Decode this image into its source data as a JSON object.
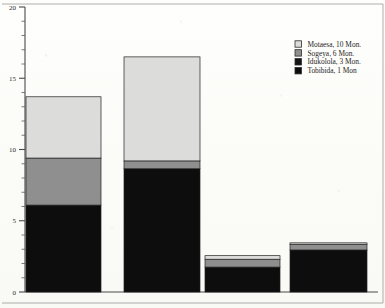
{
  "chart_data": {
    "type": "bar",
    "subtype": "stacked-bar",
    "title": "",
    "xlabel": "",
    "ylabel": "",
    "ylim": [
      0,
      20
    ],
    "yticks": [
      0,
      5,
      10,
      15,
      20
    ],
    "ytick_labels": [
      "0",
      "5",
      "10",
      "15",
      "20"
    ],
    "minor_tick_step": 1,
    "grid": false,
    "legend_position": "top-right",
    "categories": [
      "1",
      "2",
      "3",
      "4"
    ],
    "xtick_labels": [
      "",
      "",
      "",
      ""
    ],
    "series": [
      {
        "name": "Tobibida, 1 Mon",
        "color": "#0d0d0d",
        "values": [
          6.1,
          8.65,
          1.75,
          2.95
        ]
      },
      {
        "name": "Idukolola, 3 Mon.",
        "color": "#141414",
        "values": [
          0.0,
          0.0,
          0.0,
          0.0
        ]
      },
      {
        "name": "Sogeya, 6 Mon.",
        "color": "#8f8f8f",
        "values": [
          3.3,
          0.55,
          0.55,
          0.4
        ]
      },
      {
        "name": "Motaesa, 10 Mon.",
        "color": "#dcdcda",
        "values": [
          4.3,
          7.3,
          0.25,
          0.1
        ]
      }
    ],
    "bar_totals": [
      13.7,
      16.5,
      2.55,
      3.45
    ],
    "legend_entries": [
      {
        "label": "Motaesa, 10 Mon.",
        "swatch": "#dcdcda"
      },
      {
        "label": "Sogeya, 6 Mon.",
        "swatch": "#8f8f8f"
      },
      {
        "label": "Idukolola, 3 Mon.",
        "swatch": "#141414"
      },
      {
        "label": "Tobibida, 1 Mon",
        "swatch": "#0d0d0d"
      }
    ]
  },
  "axis": {
    "y_label_20": "20",
    "y_label_15": "15",
    "y_label_10": "10",
    "y_label_5": "5",
    "y_label_0": "0"
  },
  "legend": {
    "item0": "Motaesa, 10 Mon.",
    "item1": "Sogeya, 6 Mon.",
    "item2": "Idukolola, 3 Mon.",
    "item3": "Tobibida, 1 Mon"
  }
}
